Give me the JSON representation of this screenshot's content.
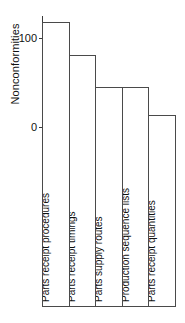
{
  "chart_data": {
    "type": "bar",
    "title": "",
    "xlabel": "",
    "ylabel": "Nonconformities",
    "ylim": [
      0,
      125
    ],
    "yticks": [
      0,
      100
    ],
    "ytick_labels": [
      "0",
      "100"
    ],
    "grid": false,
    "legend": false,
    "categories": [
      "Parts receipt procedures",
      "Parts receipt timings",
      "Parts supply routes",
      "Production sequence lists",
      "Parts receipt quantities"
    ],
    "values": [
      119,
      82,
      46,
      46,
      15
    ],
    "bar_style": {
      "fill": "#ffffff",
      "edge": "#4a4a4a"
    }
  },
  "axis": {
    "y_title": "Nonconformities",
    "ticks": [
      {
        "label": "100",
        "value": 100
      },
      {
        "label": "0",
        "value": 0
      }
    ]
  }
}
